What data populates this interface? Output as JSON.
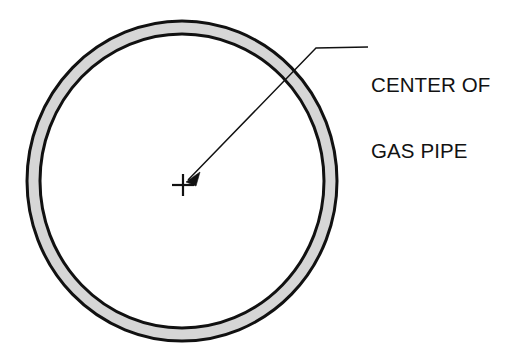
{
  "diagram": {
    "background_color": "#ffffff",
    "stroke_color": "#111111",
    "pipe": {
      "name": "gas-pipe-ring",
      "fill_color": "#d6d6d6",
      "center_x": 182,
      "center_y": 181,
      "outer_radius_x": 155,
      "outer_radius_y": 160,
      "wall_thickness": 13,
      "outline_width": 3
    },
    "center_mark": {
      "name": "center-cross-mark",
      "x": 183,
      "y": 185,
      "arm_length": 11,
      "stroke_width": 2.2
    },
    "leader": {
      "name": "callout-leader-line",
      "arrow_tip_x": 187,
      "arrow_tip_y": 181,
      "bend_x": 316,
      "bend_y": 48,
      "end_x": 368,
      "end_y": 47,
      "stroke_width": 1.3
    },
    "callout": {
      "label_line_1": "CENTER OF",
      "label_line_2": "GAS PIPE",
      "text_color": "#121212",
      "font_size_px": 20.5
    }
  }
}
